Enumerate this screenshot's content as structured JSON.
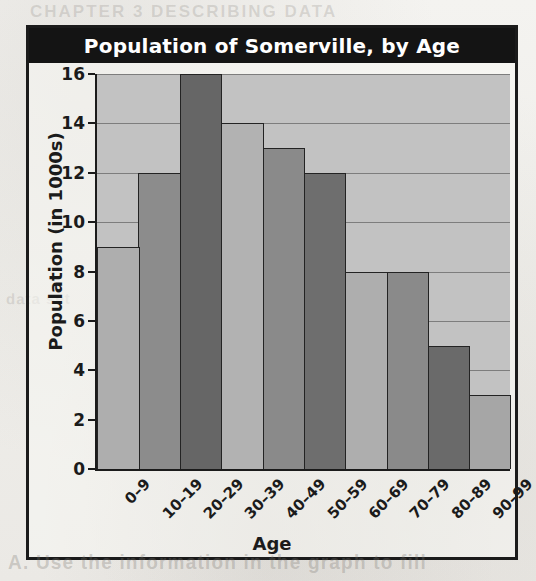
{
  "figure": {
    "title": "Population of Somerville, by Age"
  },
  "chart_data": {
    "type": "bar",
    "title": "Population of Somerville, by Age",
    "xlabel": "Age",
    "ylabel": "Population (in 1000s)",
    "categories": [
      "0–9",
      "10–19",
      "20–29",
      "30–39",
      "40–49",
      "50–59",
      "60–69",
      "70–79",
      "80–89",
      "90–99"
    ],
    "values": [
      9,
      12,
      16,
      14,
      13,
      12,
      8,
      8,
      5,
      3
    ],
    "bar_colors": [
      "#aeaeae",
      "#8c8c8c",
      "#666666",
      "#b2b2b2",
      "#8a8a8a",
      "#6e6e6e",
      "#aeaeae",
      "#8a8a8a",
      "#6a6a6a",
      "#a6a6a6"
    ],
    "ylim": [
      0,
      16
    ],
    "yticks": [
      0,
      2,
      4,
      6,
      8,
      10,
      12,
      14,
      16
    ],
    "gridlines": [
      2,
      4,
      6,
      8,
      10,
      12,
      14,
      16
    ],
    "grid": true,
    "legend": "none",
    "plot_background": "#c2c2c2",
    "axis_color": "#1b1b1b",
    "title_background": "#141414",
    "title_color": "#ffffff"
  },
  "ghost": {
    "bottom": "A. Use the information in the graph to fill",
    "top": "CHAPTER 3  DESCRIBING DATA",
    "middle": "data set"
  }
}
